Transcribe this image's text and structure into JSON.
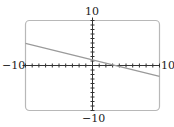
{
  "chart_data": {
    "type": "line",
    "title": "",
    "xlabel": "",
    "ylabel": "",
    "xlim": [
      -10,
      10
    ],
    "ylim": [
      -10,
      10
    ],
    "xticks_step": 1,
    "yticks_step": 1,
    "tick_labels": {
      "x_min": "−10",
      "x_max": "10",
      "y_min": "−10",
      "y_max": "10"
    },
    "series": [
      {
        "name": "line",
        "x": [
          -10,
          10
        ],
        "y": [
          4.9,
          -2.4
        ],
        "color": "#999999"
      }
    ],
    "grid": false,
    "frame": "rounded-rect"
  }
}
